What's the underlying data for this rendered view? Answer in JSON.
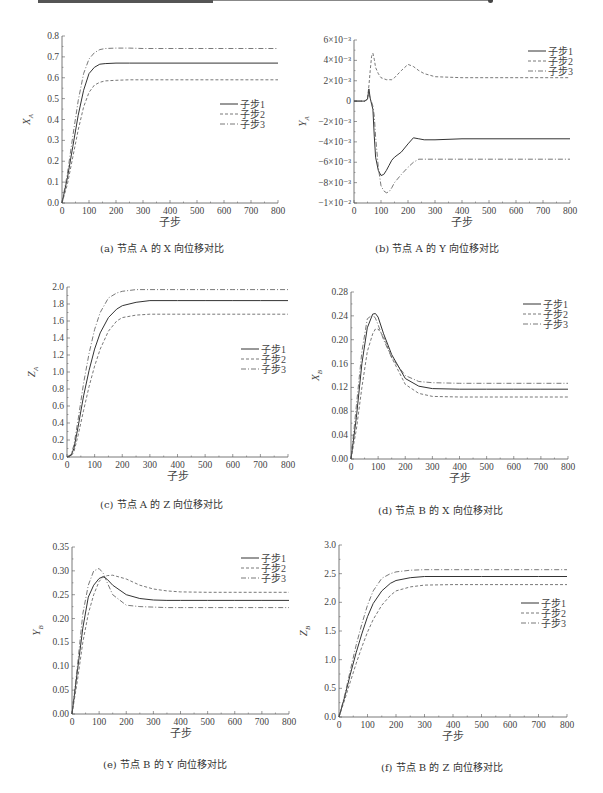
{
  "header": {
    "bar": "decorative-page-rule"
  },
  "legend_labels": [
    "子步1",
    "子步2",
    "子步3"
  ],
  "xlabel": "子步",
  "chart_data": [
    {
      "id": "a",
      "type": "line",
      "caption": "(a) 节点 A 的 X 向位移对比",
      "title": "节点 A 的 X 向位移对比",
      "xlabel": "子步",
      "ylabel": "X_A",
      "xlim": [
        0,
        800
      ],
      "ylim": [
        0,
        0.8
      ],
      "xticks": [
        0,
        100,
        200,
        300,
        400,
        500,
        600,
        700,
        800
      ],
      "yticks": [
        0.0,
        0.1,
        0.2,
        0.3,
        0.4,
        0.5,
        0.6,
        0.7,
        0.8
      ],
      "ytick_labels": [
        "0.0",
        "0.1",
        "0.2",
        "0.3",
        "0.4",
        "0.5",
        "0.6",
        "0.7",
        "0.8"
      ],
      "legend_position": "right-middle",
      "x": [
        0,
        20,
        40,
        60,
        80,
        100,
        120,
        140,
        160,
        200,
        250,
        300,
        400,
        500,
        600,
        700,
        800
      ],
      "series": [
        {
          "name": "子步1",
          "style": "solid",
          "values": [
            0,
            0.12,
            0.27,
            0.42,
            0.54,
            0.62,
            0.65,
            0.665,
            0.668,
            0.67,
            0.67,
            0.67,
            0.67,
            0.67,
            0.67,
            0.67,
            0.67
          ]
        },
        {
          "name": "子步2",
          "style": "dashed",
          "values": [
            0,
            0.09,
            0.22,
            0.35,
            0.46,
            0.53,
            0.565,
            0.578,
            0.585,
            0.588,
            0.59,
            0.59,
            0.59,
            0.59,
            0.59,
            0.59,
            0.59
          ]
        },
        {
          "name": "子步3",
          "style": "dashdot",
          "values": [
            0,
            0.14,
            0.32,
            0.49,
            0.62,
            0.69,
            0.72,
            0.735,
            0.74,
            0.742,
            0.742,
            0.74,
            0.74,
            0.74,
            0.74,
            0.74,
            0.74
          ]
        }
      ]
    },
    {
      "id": "b",
      "type": "line",
      "caption": "(b) 节点 A 的 Y 向位移对比",
      "title": "节点 A 的 Y 向位移对比",
      "xlabel": "子步",
      "ylabel": "Y_A",
      "xlim": [
        0,
        800
      ],
      "ylim": [
        -0.01,
        0.006
      ],
      "xticks": [
        0,
        100,
        200,
        300,
        400,
        500,
        600,
        700,
        800
      ],
      "yticks": [
        0.006,
        0.004,
        0.002,
        0,
        -0.002,
        -0.004,
        -0.006,
        -0.008,
        -0.01
      ],
      "ytick_labels": [
        "6×10⁻³",
        "4×10⁻³",
        "2×10⁻³",
        "0",
        "−2×10⁻³",
        "−4×10⁻³",
        "−6×10⁻³",
        "−8×10⁻³",
        "−1×10⁻²"
      ],
      "legend_position": "upper-right",
      "x": [
        0,
        40,
        50,
        55,
        60,
        65,
        70,
        75,
        80,
        90,
        100,
        110,
        120,
        130,
        140,
        150,
        175,
        200,
        220,
        240,
        260,
        300,
        400,
        500,
        600,
        700,
        800
      ],
      "series": [
        {
          "name": "子步1",
          "style": "solid",
          "values": [
            0,
            0,
            0.0002,
            0.0012,
            0.0003,
            -0.0003,
            -0.0008,
            -0.0035,
            -0.0055,
            -0.0068,
            -0.0073,
            -0.0072,
            -0.0068,
            -0.0063,
            -0.0058,
            -0.0055,
            -0.005,
            -0.0042,
            -0.0036,
            -0.0037,
            -0.0038,
            -0.0038,
            -0.0037,
            -0.0037,
            -0.0037,
            -0.0037,
            -0.0037
          ]
        },
        {
          "name": "子步2",
          "style": "dashed",
          "values": [
            0,
            0,
            0.0003,
            0.0015,
            0.003,
            0.0044,
            0.0047,
            0.0041,
            0.0033,
            0.0027,
            0.0023,
            0.0022,
            0.0021,
            0.0021,
            0.0021,
            0.0023,
            0.003,
            0.0036,
            0.0034,
            0.003,
            0.0027,
            0.0024,
            0.0023,
            0.0023,
            0.0023,
            0.0023,
            0.0023
          ]
        },
        {
          "name": "子步3",
          "style": "dashdot",
          "values": [
            0,
            0,
            0.0002,
            0.0008,
            0.0002,
            -0.0001,
            -0.0005,
            -0.0015,
            -0.0035,
            -0.0065,
            -0.0083,
            -0.0088,
            -0.009,
            -0.0089,
            -0.0085,
            -0.008,
            -0.0072,
            -0.0065,
            -0.006,
            -0.0057,
            -0.0057,
            -0.0057,
            -0.0057,
            -0.0057,
            -0.0057,
            -0.0057,
            -0.0057
          ]
        }
      ]
    },
    {
      "id": "c",
      "type": "line",
      "caption": "(c) 节点 A 的 Z 向位移对比",
      "title": "节点 A 的 Z 向位移对比",
      "xlabel": "子步",
      "ylabel": "Z_A",
      "xlim": [
        0,
        800
      ],
      "ylim": [
        0,
        2.0
      ],
      "xticks": [
        0,
        100,
        200,
        300,
        400,
        500,
        600,
        700,
        800
      ],
      "yticks": [
        0.0,
        0.2,
        0.4,
        0.6,
        0.8,
        1.0,
        1.2,
        1.4,
        1.6,
        1.8,
        2.0
      ],
      "ytick_labels": [
        "0.0",
        "0.2",
        "0.4",
        "0.6",
        "0.8",
        "1.0",
        "1.2",
        "1.4",
        "1.6",
        "1.8",
        "2.0"
      ],
      "legend_position": "right-middle",
      "x": [
        0,
        15,
        25,
        40,
        60,
        80,
        100,
        120,
        150,
        180,
        200,
        250,
        300,
        400,
        500,
        600,
        700,
        800
      ],
      "series": [
        {
          "name": "子步1",
          "style": "solid",
          "values": [
            0,
            0.02,
            0.1,
            0.35,
            0.72,
            1.02,
            1.27,
            1.46,
            1.64,
            1.74,
            1.78,
            1.82,
            1.84,
            1.84,
            1.84,
            1.84,
            1.84,
            1.84
          ]
        },
        {
          "name": "子步2",
          "style": "dashed",
          "values": [
            0,
            0.01,
            0.06,
            0.25,
            0.55,
            0.83,
            1.07,
            1.27,
            1.48,
            1.6,
            1.64,
            1.67,
            1.68,
            1.68,
            1.68,
            1.68,
            1.68,
            1.68
          ]
        },
        {
          "name": "子步3",
          "style": "dashdot",
          "values": [
            0,
            0.03,
            0.14,
            0.43,
            0.87,
            1.22,
            1.5,
            1.7,
            1.87,
            1.93,
            1.95,
            1.97,
            1.97,
            1.97,
            1.97,
            1.97,
            1.97,
            1.97
          ]
        }
      ]
    },
    {
      "id": "d",
      "type": "line",
      "caption": "(d) 节点 B 的 X 向位移对比",
      "title": "节点 B 的 X 向位移对比",
      "xlabel": "子步",
      "ylabel": "X_B",
      "xlim": [
        0,
        800
      ],
      "ylim": [
        0,
        0.28
      ],
      "xticks": [
        0,
        100,
        200,
        300,
        400,
        500,
        600,
        700,
        800
      ],
      "yticks": [
        0.0,
        0.04,
        0.08,
        0.12,
        0.16,
        0.2,
        0.24,
        0.28
      ],
      "ytick_labels": [
        "0.00",
        "0.04",
        "0.08",
        "0.12",
        "0.16",
        "0.20",
        "0.24",
        "0.28"
      ],
      "legend_position": "upper-right",
      "x": [
        0,
        20,
        40,
        60,
        80,
        90,
        100,
        120,
        150,
        200,
        250,
        300,
        400,
        500,
        600,
        700,
        800
      ],
      "series": [
        {
          "name": "子步1",
          "style": "solid",
          "values": [
            0,
            0.07,
            0.16,
            0.22,
            0.243,
            0.244,
            0.238,
            0.21,
            0.175,
            0.135,
            0.122,
            0.118,
            0.117,
            0.117,
            0.117,
            0.117,
            0.117
          ]
        },
        {
          "name": "子步2",
          "style": "dashed",
          "values": [
            0,
            0.05,
            0.12,
            0.18,
            0.21,
            0.218,
            0.218,
            0.205,
            0.17,
            0.125,
            0.11,
            0.105,
            0.104,
            0.104,
            0.104,
            0.104,
            0.104
          ]
        },
        {
          "name": "子步3",
          "style": "dashdot",
          "values": [
            0,
            0.09,
            0.18,
            0.235,
            0.242,
            0.236,
            0.225,
            0.2,
            0.17,
            0.14,
            0.13,
            0.128,
            0.127,
            0.127,
            0.127,
            0.127,
            0.127
          ]
        }
      ]
    },
    {
      "id": "e",
      "type": "line",
      "caption": "(e) 节点 B 的 Y 向位移对比",
      "title": "节点 B 的 Y 向位移对比",
      "xlabel": "子步",
      "ylabel": "Y_B",
      "xlim": [
        0,
        800
      ],
      "ylim": [
        0,
        0.35
      ],
      "xticks": [
        0,
        100,
        200,
        300,
        400,
        500,
        600,
        700,
        800
      ],
      "yticks": [
        0.0,
        0.05,
        0.1,
        0.15,
        0.2,
        0.25,
        0.3,
        0.35
      ],
      "ytick_labels": [
        "0.00",
        "0.05",
        "0.10",
        "0.15",
        "0.20",
        "0.25",
        "0.30",
        "0.35"
      ],
      "legend_position": "upper-right",
      "x": [
        0,
        20,
        40,
        60,
        80,
        100,
        115,
        130,
        150,
        200,
        250,
        300,
        350,
        400,
        500,
        600,
        700,
        800
      ],
      "series": [
        {
          "name": "子步1",
          "style": "solid",
          "values": [
            0,
            0.09,
            0.18,
            0.245,
            0.27,
            0.284,
            0.288,
            0.282,
            0.27,
            0.25,
            0.242,
            0.239,
            0.238,
            0.238,
            0.238,
            0.238,
            0.238,
            0.238
          ]
        },
        {
          "name": "子步2",
          "style": "dashed",
          "values": [
            0,
            0.07,
            0.15,
            0.21,
            0.25,
            0.278,
            0.287,
            0.29,
            0.291,
            0.283,
            0.27,
            0.262,
            0.258,
            0.256,
            0.255,
            0.255,
            0.255,
            0.255
          ]
        },
        {
          "name": "子步3",
          "style": "dashdot",
          "values": [
            0,
            0.1,
            0.21,
            0.27,
            0.3,
            0.305,
            0.295,
            0.275,
            0.25,
            0.228,
            0.225,
            0.224,
            0.223,
            0.223,
            0.223,
            0.223,
            0.223,
            0.223
          ]
        }
      ]
    },
    {
      "id": "f",
      "type": "line",
      "caption": "(f) 节点 B 的 Z 向位移对比",
      "title": "节点 B 的 Z 向位移对比",
      "xlabel": "子步",
      "ylabel": "Z_B",
      "xlim": [
        0,
        800
      ],
      "ylim": [
        0,
        3.0
      ],
      "xticks": [
        0,
        100,
        200,
        300,
        400,
        500,
        600,
        700,
        800
      ],
      "yticks": [
        0.0,
        0.5,
        1.0,
        1.5,
        2.0,
        2.5,
        3.0
      ],
      "ytick_labels": [
        "0.0",
        "0.5",
        "1.0",
        "1.5",
        "2.0",
        "2.5",
        "3.0"
      ],
      "legend_position": "right-middle",
      "x": [
        0,
        20,
        40,
        60,
        80,
        100,
        120,
        150,
        180,
        200,
        250,
        300,
        400,
        500,
        600,
        700,
        800
      ],
      "series": [
        {
          "name": "子步1",
          "style": "solid",
          "values": [
            0,
            0.35,
            0.75,
            1.12,
            1.45,
            1.75,
            1.98,
            2.2,
            2.33,
            2.38,
            2.43,
            2.45,
            2.45,
            2.45,
            2.45,
            2.45,
            2.45
          ]
        },
        {
          "name": "子步2",
          "style": "dashed",
          "values": [
            0,
            0.3,
            0.62,
            0.93,
            1.22,
            1.48,
            1.7,
            1.95,
            2.12,
            2.2,
            2.27,
            2.3,
            2.31,
            2.31,
            2.31,
            2.31,
            2.31
          ]
        },
        {
          "name": "子步3",
          "style": "dashdot",
          "values": [
            0,
            0.38,
            0.82,
            1.25,
            1.62,
            1.95,
            2.2,
            2.42,
            2.5,
            2.53,
            2.56,
            2.57,
            2.57,
            2.57,
            2.57,
            2.57,
            2.57
          ]
        }
      ]
    }
  ]
}
